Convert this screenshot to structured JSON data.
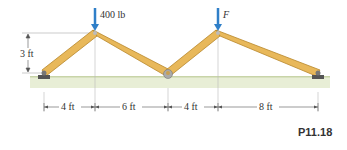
{
  "figure": {
    "label": "P11.18",
    "loads": [
      {
        "label": "400 lb",
        "joint": "B"
      },
      {
        "label": "F",
        "joint": "D"
      }
    ],
    "height_dimension": "3 ft",
    "horizontal_dimensions": [
      "4 ft",
      "6 ft",
      "4 ft",
      "8 ft"
    ],
    "colors": {
      "member": "#e8b85a",
      "member_edge": "#b8862a",
      "arrow": "#2f7fc8",
      "ground": "#e6edd2",
      "support": "#555555"
    }
  }
}
